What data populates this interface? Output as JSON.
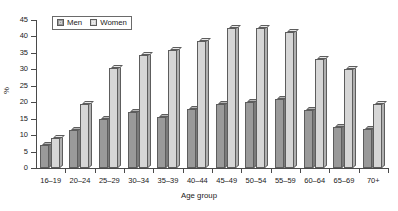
{
  "chart_data": {
    "type": "bar",
    "title": "",
    "xlabel": "Age group",
    "ylabel": "%",
    "ylim": [
      0,
      45
    ],
    "yticks": [
      0,
      5,
      10,
      15,
      20,
      25,
      30,
      35,
      40,
      45
    ],
    "grid": false,
    "legend_position": "top-left",
    "categories": [
      "16–19",
      "20–24",
      "25–29",
      "30–34",
      "35–39",
      "40–44",
      "45–49",
      "50–54",
      "55–59",
      "60–64",
      "65–69",
      "70+"
    ],
    "series": [
      {
        "name": "Men",
        "color": "#9a9a9a",
        "values": [
          7,
          11.5,
          15,
          17,
          15.5,
          18,
          19.5,
          20,
          21,
          17.5,
          12.5,
          12
        ]
      },
      {
        "name": "Women",
        "color": "#d6d6d6",
        "values": [
          9,
          19.5,
          30.5,
          34.5,
          36,
          38.5,
          42.5,
          42.5,
          41.5,
          33,
          30,
          19.5
        ]
      }
    ]
  },
  "axis": {
    "y_title": "%",
    "x_title": "Age group"
  }
}
